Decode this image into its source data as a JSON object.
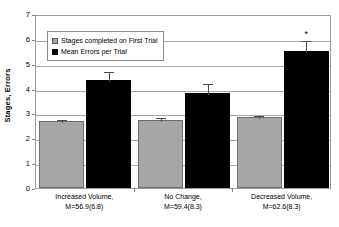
{
  "chart_data": {
    "type": "bar",
    "title": "",
    "xlabel": "",
    "ylabel": "Stages, Errors",
    "ylim": [
      0,
      7
    ],
    "yticks": [
      0,
      1,
      2,
      3,
      4,
      5,
      6,
      7
    ],
    "ytick_labels": [
      "0",
      "1",
      "2",
      "3",
      "4",
      "5",
      "6",
      "7"
    ],
    "grid": "horizontal",
    "legend_position": "upper-left-inside",
    "categories": [
      "Increased Volume, M=56.9(6.8)",
      "No Change, M=59.4(8.3)",
      "Decreased Volume, M=62.6(8.3)"
    ],
    "category_lines": [
      [
        "Increased Volume,",
        "M=56.9(6.8)"
      ],
      [
        "No Change,",
        "M=59.4(8.3)"
      ],
      [
        "Decreased Volume,",
        "M=62.6(8.3)"
      ]
    ],
    "series": [
      {
        "name": "Stages completed on First Trial",
        "color": "#a6a6a6",
        "values": [
          2.7,
          2.75,
          2.84
        ],
        "errors": [
          0.12,
          0.16,
          0.12
        ]
      },
      {
        "name": "Mean Errors per Trial",
        "color": "#000000",
        "values": [
          4.36,
          3.83,
          5.53
        ],
        "errors": [
          0.37,
          0.42,
          0.48
        ]
      }
    ],
    "annotations": [
      {
        "text": "*",
        "series": "Mean Errors per Trial",
        "category": "Decreased Volume, M=62.6(8.3)",
        "value": 6.45
      }
    ]
  },
  "legend": {
    "items": [
      {
        "label": "Stages completed on First Trial",
        "swatch": "gray"
      },
      {
        "label": "Mean Errors per Trial",
        "swatch": "black"
      }
    ]
  }
}
